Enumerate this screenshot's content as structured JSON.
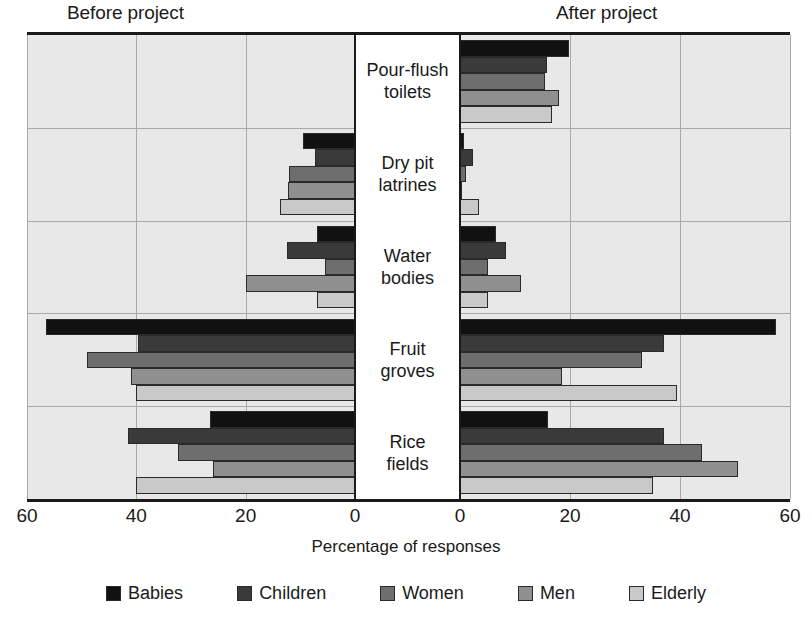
{
  "headings": {
    "left": "Before project",
    "right": "After project"
  },
  "axis": {
    "xlabel": "Percentage of responses",
    "ticks_left": [
      "60",
      "40",
      "20",
      "0"
    ],
    "ticks_right": [
      "0",
      "20",
      "40",
      "60"
    ]
  },
  "legend": {
    "items": [
      {
        "label": "Babies",
        "color": "#111111"
      },
      {
        "label": "Children",
        "color": "#3a3a3a"
      },
      {
        "label": "Women",
        "color": "#6e6e6e"
      },
      {
        "label": "Men",
        "color": "#8f8f8f"
      },
      {
        "label": "Elderly",
        "color": "#c9c9c9"
      }
    ]
  },
  "chart_data": {
    "type": "bar",
    "title": "",
    "subtitle": "",
    "orientation": "horizontal",
    "layout": "diverging-pyramid",
    "xlabel": "Percentage of responses",
    "ylabel": "",
    "grid": true,
    "legend_position": "bottom",
    "panels": [
      {
        "name": "Before project",
        "direction": "left",
        "xlim": [
          0,
          60
        ],
        "tick_labels": [
          "60",
          "40",
          "20",
          "0"
        ]
      },
      {
        "name": "After project",
        "direction": "right",
        "xlim": [
          0,
          60
        ],
        "tick_labels": [
          "0",
          "20",
          "40",
          "60"
        ]
      }
    ],
    "categories": [
      "Pour-flush toilets",
      "Dry pit latrines",
      "Water bodies",
      "Fruit groves",
      "Rice fields"
    ],
    "category_labels": [
      [
        "Pour-flush",
        "toilets"
      ],
      [
        "Dry pit",
        "latrines"
      ],
      [
        "Water",
        "bodies"
      ],
      [
        "Fruit",
        "groves"
      ],
      [
        "Rice",
        "fields"
      ]
    ],
    "series": [
      {
        "name": "Babies",
        "color": "#111111",
        "before": [
          0,
          9.6,
          7.0,
          56.5,
          26.5
        ],
        "after": [
          19.8,
          0.8,
          6.5,
          57.5,
          16.0
        ]
      },
      {
        "name": "Children",
        "color": "#3a3a3a",
        "before": [
          0,
          7.3,
          12.5,
          39.7,
          41.5
        ],
        "after": [
          15.8,
          2.3,
          8.3,
          37.0,
          37.0
        ]
      },
      {
        "name": "Women",
        "color": "#6e6e6e",
        "before": [
          0,
          12.0,
          5.5,
          49.0,
          32.3
        ],
        "after": [
          15.5,
          1.0,
          5.0,
          33.0,
          44.0
        ]
      },
      {
        "name": "Men",
        "color": "#8f8f8f",
        "before": [
          0,
          12.3,
          20.0,
          41.0,
          26.0
        ],
        "after": [
          18.0,
          0.3,
          11.0,
          18.5,
          50.5
        ]
      },
      {
        "name": "Elderly",
        "color": "#c9c9c9",
        "before": [
          0,
          13.8,
          7.0,
          40.0,
          40.0
        ],
        "after": [
          16.8,
          3.5,
          5.0,
          39.5,
          35.0
        ]
      }
    ]
  }
}
